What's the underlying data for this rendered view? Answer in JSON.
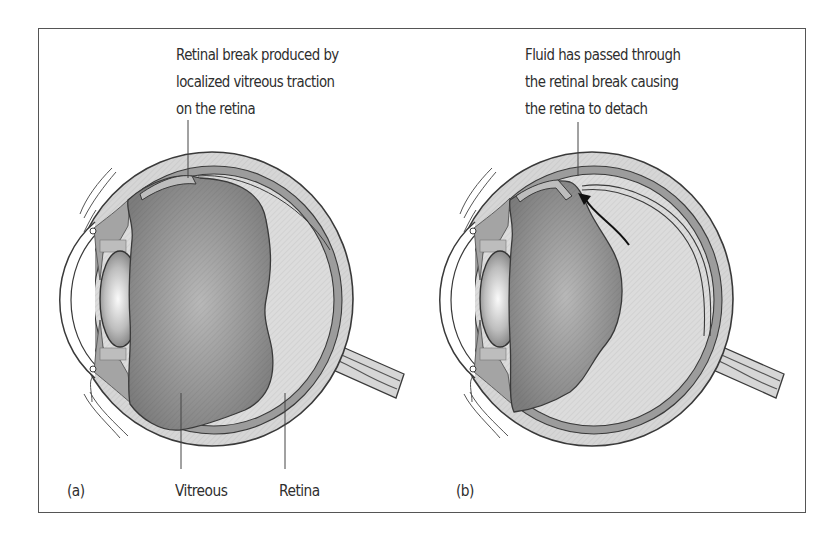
{
  "figure": {
    "panels": [
      {
        "id": "a",
        "panel_label": "(a)",
        "caption_lines": [
          "Retinal break produced by",
          "localized vitreous traction",
          "on the retina"
        ],
        "bottom_labels": {
          "vitreous": "Vitreous",
          "retina": "Retina"
        }
      },
      {
        "id": "b",
        "panel_label": "(b)",
        "caption_lines": [
          "Fluid has passed through",
          "the retinal break causing",
          "the retina to detach"
        ]
      }
    ],
    "colors": {
      "frame": "#555555",
      "text": "#2e2e2e",
      "outline": "#3a3a3a",
      "sclera": "#d6d6d6",
      "choroid": "#9c9c9c",
      "subretinal_fluid": "#dcdcdc",
      "vitreous_edge": "#7e7e7e",
      "vitreous_center": "#b4b4b4",
      "lens_edge": "#6a6a6a",
      "lens_center": "#f4f4f4",
      "ciliary": "#a4a4a4"
    }
  }
}
